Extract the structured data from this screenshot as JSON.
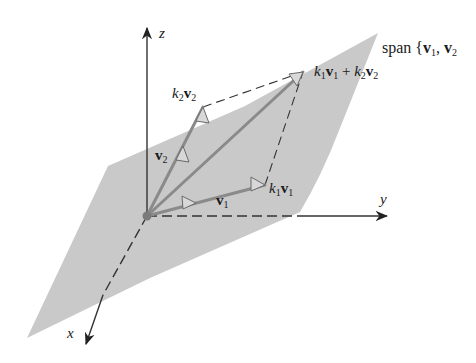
{
  "figure": {
    "plane_label": {
      "prefix": "span {",
      "v1": "v",
      "v1_sub": "1",
      "sep": ", ",
      "v2": "v",
      "v2_sub": "2"
    },
    "axes": {
      "x": "x",
      "y": "y",
      "z": "z"
    },
    "vectors": {
      "v1": {
        "name": "v",
        "sub": "1"
      },
      "v2": {
        "name": "v",
        "sub": "2"
      },
      "k1v1": {
        "coef": "k",
        "coef_sub": "1",
        "name": "v",
        "sub": "1"
      },
      "k2v2": {
        "coef": "k",
        "coef_sub": "2",
        "name": "v",
        "sub": "2"
      },
      "sum": {
        "coef1": "k",
        "coef1_sub": "1",
        "name1": "v",
        "name1_sub": "1",
        "plus": " + ",
        "coef2": "k",
        "coef2_sub": "2",
        "name2": "v",
        "name2_sub": "2"
      }
    },
    "colors": {
      "plane": "#c8c8c8",
      "vector": "#8a8a8a",
      "axis": "#333333",
      "text": "#1a1a1a"
    }
  }
}
